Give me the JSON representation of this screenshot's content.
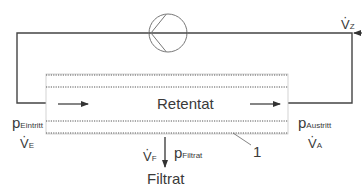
{
  "diagram": {
    "retentate_label": "Retentat",
    "filtrate_label": "Filtrat",
    "membrane_ref": "1",
    "pump_symbol": "pump-icon",
    "inlet": {
      "pressure_symbol": "p",
      "pressure_sub": "Eintritt",
      "flow_symbol": "V",
      "flow_sub": "E"
    },
    "outlet": {
      "pressure_symbol": "p",
      "pressure_sub": "Austritt",
      "flow_symbol": "V",
      "flow_sub": "A"
    },
    "feed": {
      "flow_symbol": "V",
      "flow_sub": "Z"
    },
    "permeate": {
      "flow_symbol": "V",
      "flow_sub": "F",
      "pressure_symbol": "p",
      "pressure_sub": "Filtrat"
    },
    "colors": {
      "line": "#3a3a3a",
      "membrane": "#555555",
      "frame": "#bbbbbb"
    }
  }
}
